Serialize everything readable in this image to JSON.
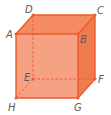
{
  "figure": {
    "type": "cube",
    "colors": {
      "front_face": "#F4A283",
      "top_face": "#F58B62",
      "right_face": "#F07B4E",
      "edge": "#EE5A28",
      "label": "#5A5A5A"
    },
    "vertices": {
      "A": {
        "label": "A",
        "x": 16,
        "y": 34
      },
      "B": {
        "label": "B",
        "x": 78,
        "y": 34
      },
      "C": {
        "label": "C",
        "x": 95,
        "y": 15
      },
      "D": {
        "label": "D",
        "x": 33,
        "y": 15
      },
      "E": {
        "label": "E",
        "x": 33,
        "y": 79
      },
      "F": {
        "label": "F",
        "x": 95,
        "y": 79
      },
      "G": {
        "label": "G",
        "x": 78,
        "y": 98
      },
      "H": {
        "label": "H",
        "x": 16,
        "y": 98
      }
    },
    "visible_edges": [
      "AB",
      "BC",
      "CD",
      "DA",
      "AH",
      "HG",
      "GB",
      "GF",
      "FC"
    ],
    "hidden_edges": [
      "DE",
      "EF",
      "EH"
    ]
  }
}
